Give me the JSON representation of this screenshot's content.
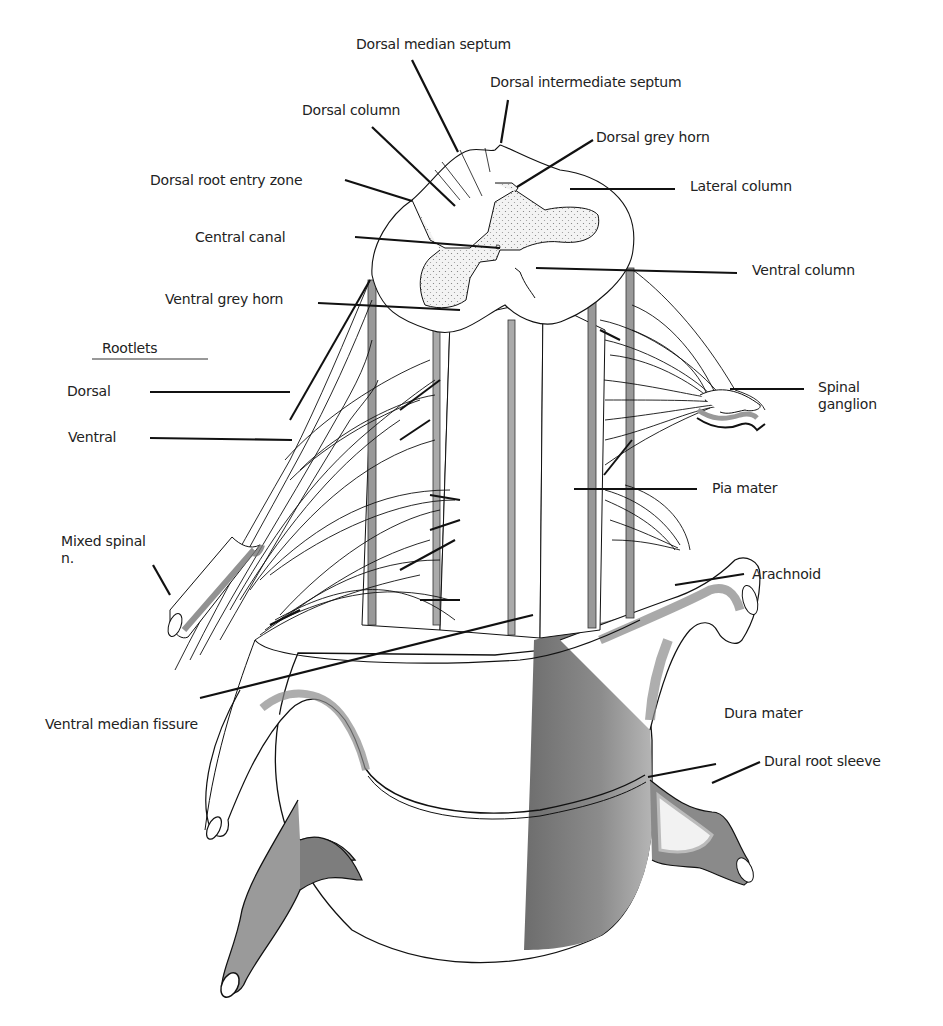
{
  "figure": {
    "labels": {
      "dorsal_median_septum": "Dorsal median septum",
      "dorsal_intermediate_septum": "Dorsal intermediate septum",
      "dorsal_column": "Dorsal column",
      "dorsal_grey_horn": "Dorsal grey horn",
      "dorsal_root_entry_zone": "Dorsal root entry zone",
      "lateral_column": "Lateral column",
      "central_canal": "Central canal",
      "ventral_column": "Ventral column",
      "ventral_grey_horn": "Ventral grey horn",
      "rootlets_heading": "Rootlets",
      "rootlets_dorsal": "Dorsal",
      "rootlets_ventral": "Ventral",
      "spinal_ganglion_1": "Spinal",
      "spinal_ganglion_2": "ganglion",
      "pia_mater": "Pia mater",
      "mixed_spinal_1": "Mixed spinal",
      "mixed_spinal_2": "n.",
      "arachnoid": "Arachnoid",
      "ventral_median_fissure": "Ventral median fissure",
      "dura_mater": "Dura mater",
      "dural_root_sleeve": "Dural root sleeve"
    },
    "colors": {
      "line": "#111111",
      "grey_matter": "#ececec",
      "dura_dark": "#7a7a7a",
      "dura_mid": "#9a9a9a",
      "dura_light": "#c8c8c8"
    }
  }
}
